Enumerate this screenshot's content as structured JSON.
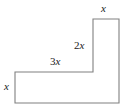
{
  "figure": {
    "type": "geometry-diagram",
    "shape_name": "L-shaped-polygon",
    "stroke_color": "#808080",
    "fill_color": "#ffffff",
    "background_color": "#ffffff",
    "label_color": "#1a1a1a",
    "vertices": [
      [
        15,
        72
      ],
      [
        93,
        72
      ],
      [
        93,
        19
      ],
      [
        119,
        19
      ],
      [
        119,
        103
      ],
      [
        15,
        103
      ]
    ],
    "labels": {
      "top": {
        "coefficient": "",
        "variable": "x",
        "full": "x"
      },
      "right": {
        "coefficient": "2",
        "variable": "x",
        "full": "2x"
      },
      "middle": {
        "coefficient": "3",
        "variable": "x",
        "full": "3x"
      },
      "left": {
        "coefficient": "",
        "variable": "x",
        "full": "x"
      }
    }
  }
}
